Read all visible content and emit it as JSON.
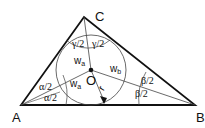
{
  "diagram": {
    "vertices": {
      "A": {
        "label": "A",
        "x": 21,
        "y": 105
      },
      "B": {
        "label": "B",
        "x": 195,
        "y": 105
      },
      "C": {
        "label": "C",
        "x": 84,
        "y": 17
      }
    },
    "incenter": {
      "label": "O",
      "x": 91,
      "y": 70
    },
    "incircle_radius": 35,
    "radius_label": "r",
    "angle_labels": {
      "alpha_upper": "α/2",
      "alpha_lower": "α/2",
      "beta_upper": "β/2",
      "beta_lower": "β/2",
      "gamma_left": "γ/2",
      "gamma_right": "γ/2"
    },
    "segment_labels": {
      "wa_upper": {
        "main": "w",
        "sub": "a"
      },
      "wa_lower": {
        "main": "w",
        "sub": "a"
      },
      "wb": {
        "main": "w",
        "sub": "b"
      }
    },
    "colors": {
      "stroke": "#111111",
      "background": "#ffffff"
    }
  }
}
